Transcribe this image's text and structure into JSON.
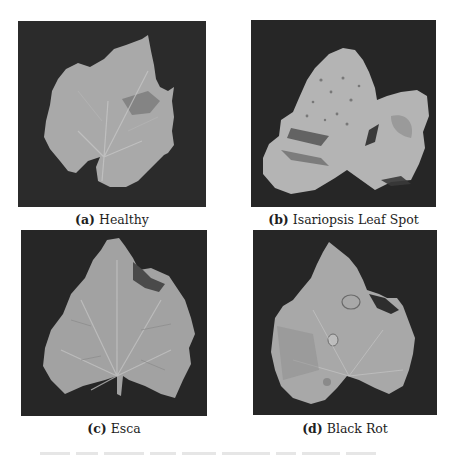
{
  "figure": {
    "panels": [
      {
        "id": "a",
        "label": "(a)",
        "title": "Healthy",
        "background_color": "#2a2a2a",
        "leaf_color": "#a9a9a9"
      },
      {
        "id": "b",
        "label": "(b)",
        "title": "Isariopsis Leaf Spot",
        "background_color": "#262626",
        "leaf_color": "#b4b4b4"
      },
      {
        "id": "c",
        "label": "(c)",
        "title": "Esca",
        "background_color": "#262626",
        "leaf_color": "#9f9f9f"
      },
      {
        "id": "d",
        "label": "(d)",
        "title": "Black Rot",
        "background_color": "#262626",
        "leaf_color": "#a8a8a8"
      }
    ]
  }
}
